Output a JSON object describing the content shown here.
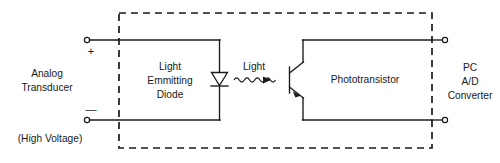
{
  "diagram": {
    "colors": {
      "ink": "#1a1a1a",
      "background": "#ffffff"
    },
    "labels": {
      "left_source_line1": "Analog",
      "left_source_line2": "Transducer",
      "left_note": "(High Voltage)",
      "plus_sign": "+",
      "minus_sign": "—",
      "led_line1": "Light",
      "led_line2": "Emmitting",
      "led_line3": "Diode",
      "light_label": "Light",
      "phototransistor": "Phototransistor",
      "right_sink_line1": "PC",
      "right_sink_line2": "A/D",
      "right_sink_line3": "Converter"
    },
    "components": [
      {
        "name": "light-emitting-diode",
        "label": "Light Emmitting Diode"
      },
      {
        "name": "phototransistor",
        "label": "Phototransistor"
      },
      {
        "name": "optical-coupling",
        "label": "Light"
      }
    ],
    "terminals": [
      {
        "name": "input-positive",
        "sign": "+",
        "side": "left",
        "position": "top"
      },
      {
        "name": "input-negative",
        "sign": "—",
        "side": "left",
        "position": "bottom"
      },
      {
        "name": "output-top",
        "sign": "",
        "side": "right",
        "position": "top"
      },
      {
        "name": "output-bottom",
        "sign": "",
        "side": "right",
        "position": "bottom"
      }
    ]
  }
}
